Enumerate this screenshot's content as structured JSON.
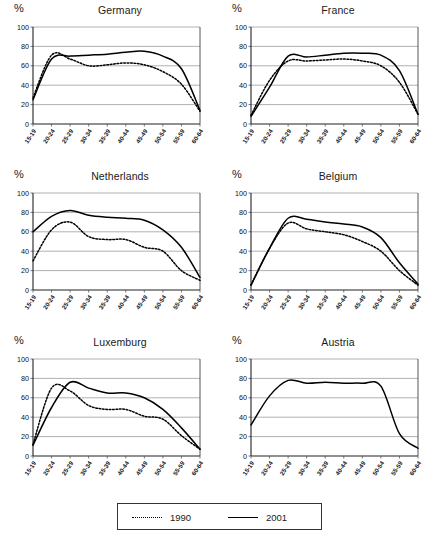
{
  "axes": {
    "y_unit_label": "%",
    "y_ticks": [
      "0",
      "20",
      "40",
      "60",
      "80",
      "100"
    ],
    "x_ticks": [
      "15-19",
      "20-24",
      "25-29",
      "30-34",
      "35-39",
      "40-44",
      "45-49",
      "50-54",
      "55-59",
      "60-64"
    ],
    "ylim": [
      0,
      100
    ],
    "grid": true
  },
  "legend": {
    "position": "bottom-center",
    "entries": [
      {
        "label": "1990",
        "style": "dotted"
      },
      {
        "label": "2001",
        "style": "solid"
      }
    ]
  },
  "panels": [
    {
      "title": "Germany"
    },
    {
      "title": "France"
    },
    {
      "title": "Netherlands"
    },
    {
      "title": "Belgium"
    },
    {
      "title": "Luxemburg"
    },
    {
      "title": "Austria"
    }
  ],
  "chart_data": [
    {
      "type": "line",
      "title": "Germany",
      "xlabel": "",
      "ylabel": "%",
      "ylim": [
        0,
        100
      ],
      "grid": true,
      "categories": [
        "15-19",
        "20-24",
        "25-29",
        "30-34",
        "35-39",
        "40-44",
        "45-49",
        "50-54",
        "55-59",
        "60-64"
      ],
      "series": [
        {
          "name": "1990",
          "style": "dotted",
          "values": [
            27,
            71,
            67,
            60,
            61,
            63,
            61,
            54,
            41,
            13
          ]
        },
        {
          "name": "2001",
          "style": "solid",
          "values": [
            25,
            67,
            70,
            71,
            72,
            74,
            75,
            70,
            57,
            14
          ]
        }
      ]
    },
    {
      "type": "line",
      "title": "France",
      "xlabel": "",
      "ylabel": "%",
      "ylim": [
        0,
        100
      ],
      "grid": true,
      "categories": [
        "15-19",
        "20-24",
        "25-29",
        "30-34",
        "35-39",
        "40-44",
        "45-49",
        "50-54",
        "55-59",
        "60-64"
      ],
      "series": [
        {
          "name": "1990",
          "style": "dotted",
          "values": [
            9,
            45,
            65,
            65,
            66,
            67,
            65,
            60,
            43,
            10
          ]
        },
        {
          "name": "2001",
          "style": "solid",
          "values": [
            8,
            38,
            70,
            69,
            71,
            73,
            73,
            71,
            55,
            10
          ]
        }
      ]
    },
    {
      "type": "line",
      "title": "Netherlands",
      "xlabel": "",
      "ylabel": "%",
      "ylim": [
        0,
        100
      ],
      "grid": true,
      "categories": [
        "15-19",
        "20-24",
        "25-29",
        "30-34",
        "35-39",
        "40-44",
        "45-49",
        "50-54",
        "55-59",
        "60-64"
      ],
      "series": [
        {
          "name": "1990",
          "style": "dotted",
          "values": [
            30,
            62,
            70,
            55,
            52,
            52,
            44,
            40,
            20,
            10
          ]
        },
        {
          "name": "2001",
          "style": "solid",
          "values": [
            60,
            76,
            82,
            77,
            75,
            74,
            72,
            62,
            44,
            13
          ]
        }
      ]
    },
    {
      "type": "line",
      "title": "Belgium",
      "xlabel": "",
      "ylabel": "%",
      "ylim": [
        0,
        100
      ],
      "grid": true,
      "categories": [
        "15-19",
        "20-24",
        "25-29",
        "30-34",
        "35-39",
        "40-44",
        "45-49",
        "50-54",
        "55-59",
        "60-64"
      ],
      "series": [
        {
          "name": "1990",
          "style": "dotted",
          "values": [
            5,
            43,
            69,
            63,
            60,
            57,
            50,
            40,
            20,
            5
          ]
        },
        {
          "name": "2001",
          "style": "solid",
          "values": [
            5,
            43,
            74,
            73,
            70,
            68,
            65,
            54,
            28,
            6
          ]
        }
      ]
    },
    {
      "type": "line",
      "title": "Luxemburg",
      "xlabel": "",
      "ylabel": "%",
      "ylim": [
        0,
        100
      ],
      "grid": true,
      "categories": [
        "15-19",
        "20-24",
        "25-29",
        "30-34",
        "35-39",
        "40-44",
        "45-49",
        "50-54",
        "55-59",
        "60-64"
      ],
      "series": [
        {
          "name": "1990",
          "style": "dotted",
          "values": [
            12,
            70,
            67,
            52,
            48,
            48,
            41,
            38,
            21,
            7
          ]
        },
        {
          "name": "2001",
          "style": "solid",
          "values": [
            11,
            50,
            76,
            70,
            65,
            65,
            60,
            48,
            29,
            7
          ]
        }
      ]
    },
    {
      "type": "line",
      "title": "Austria",
      "xlabel": "",
      "ylabel": "%",
      "ylim": [
        0,
        100
      ],
      "grid": true,
      "categories": [
        "15-19",
        "20-24",
        "25-29",
        "30-34",
        "35-39",
        "40-44",
        "45-49",
        "50-54",
        "55-59",
        "60-64"
      ],
      "series": [
        {
          "name": "2001",
          "style": "solid",
          "values": [
            32,
            62,
            78,
            75,
            76,
            75,
            75,
            72,
            23,
            8
          ]
        }
      ]
    }
  ]
}
